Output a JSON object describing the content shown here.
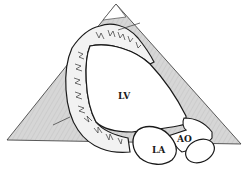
{
  "diagram": {
    "type": "echocardiography apical long-axis sketch",
    "labels": {
      "lv": "LV",
      "la": "LA",
      "ao": "AO"
    },
    "colors": {
      "background": "#ffffff",
      "sector_fill": "#d4d4d4",
      "outline": "#1a1a1a",
      "chamber_fill": "#ffffff",
      "myocardium_fill": "#e8e8e8"
    }
  }
}
